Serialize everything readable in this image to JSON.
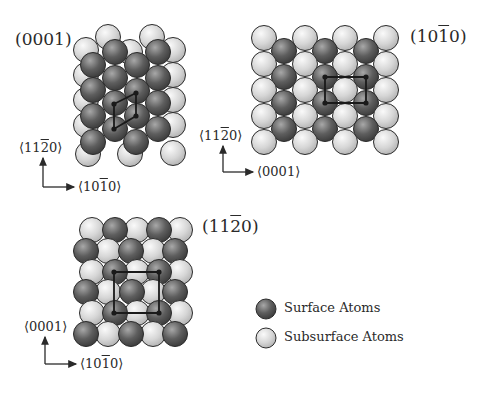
{
  "colors": {
    "surface": "#5a5a5a",
    "surface_light": "#9a9a9a",
    "subsurface": "#d4d4d4",
    "subsurface_light": "#f4f4f4",
    "outline": "#2b2b2b",
    "cell": "#1a1a1a",
    "text": "#2a2a2a"
  },
  "atom_radius": 12.5,
  "panels": [
    {
      "id": "0001",
      "title": {
        "pre": "(000",
        "bar": "",
        "post": "1)",
        "x": 15,
        "y": 29
      },
      "axis": {
        "up_label": {
          "pre": "⟨11",
          "bar": "2",
          "post": "0⟩",
          "x": 19,
          "y": 140
        },
        "right_label": {
          "pre": "⟨10",
          "bar": "1",
          "post": "0⟩",
          "x": 78,
          "y": 179
        },
        "origin": [
          43,
          187
        ],
        "up_end": [
          43,
          158
        ],
        "right_end": [
          74,
          187
        ]
      },
      "atoms": [
        {
          "x": 108,
          "y": 37,
          "t": "sub"
        },
        {
          "x": 152,
          "y": 37,
          "t": "sub"
        },
        {
          "x": 86,
          "y": 50,
          "t": "sub"
        },
        {
          "x": 130,
          "y": 52,
          "t": "sub"
        },
        {
          "x": 173,
          "y": 50,
          "t": "sub"
        },
        {
          "x": 115,
          "y": 52,
          "t": "surf"
        },
        {
          "x": 158,
          "y": 52,
          "t": "surf"
        },
        {
          "x": 86,
          "y": 75,
          "t": "sub"
        },
        {
          "x": 173,
          "y": 75,
          "t": "sub"
        },
        {
          "x": 93,
          "y": 65,
          "t": "surf"
        },
        {
          "x": 137,
          "y": 65,
          "t": "surf"
        },
        {
          "x": 115,
          "y": 78,
          "t": "surf"
        },
        {
          "x": 158,
          "y": 78,
          "t": "surf"
        },
        {
          "x": 86,
          "y": 100,
          "t": "sub"
        },
        {
          "x": 173,
          "y": 100,
          "t": "sub"
        },
        {
          "x": 93,
          "y": 90,
          "t": "surf"
        },
        {
          "x": 137,
          "y": 91,
          "t": "surf"
        },
        {
          "x": 115,
          "y": 103,
          "t": "surf"
        },
        {
          "x": 158,
          "y": 103,
          "t": "surf"
        },
        {
          "x": 86,
          "y": 125,
          "t": "sub"
        },
        {
          "x": 173,
          "y": 125,
          "t": "sub"
        },
        {
          "x": 93,
          "y": 116,
          "t": "surf"
        },
        {
          "x": 137,
          "y": 116,
          "t": "surf"
        },
        {
          "x": 115,
          "y": 129,
          "t": "surf"
        },
        {
          "x": 158,
          "y": 129,
          "t": "surf"
        },
        {
          "x": 88,
          "y": 154,
          "t": "sub"
        },
        {
          "x": 130,
          "y": 154,
          "t": "sub"
        },
        {
          "x": 173,
          "y": 153,
          "t": "sub"
        },
        {
          "x": 93,
          "y": 142,
          "t": "surf"
        },
        {
          "x": 136,
          "y": 142,
          "t": "surf"
        }
      ],
      "cell": [
        [
          136,
          93
        ],
        [
          114,
          104
        ],
        [
          114,
          129
        ],
        [
          136,
          116
        ]
      ]
    },
    {
      "id": "10-10",
      "title": {
        "pre": "(10",
        "bar": "1",
        "post": "0)",
        "x": 410,
        "y": 26
      },
      "axis": {
        "up_label": {
          "pre": "⟨11",
          "bar": "2",
          "post": "0⟩",
          "x": 199,
          "y": 128
        },
        "right_label": {
          "pre": "⟨000",
          "bar": "",
          "post": "1⟩",
          "x": 257,
          "y": 164
        },
        "origin": [
          223,
          172
        ],
        "up_end": [
          223,
          146
        ],
        "right_end": [
          253,
          172
        ]
      },
      "atoms": [
        {
          "x": 264,
          "y": 38,
          "t": "sub"
        },
        {
          "x": 305,
          "y": 38,
          "t": "sub"
        },
        {
          "x": 345,
          "y": 38,
          "t": "sub"
        },
        {
          "x": 386,
          "y": 38,
          "t": "sub"
        },
        {
          "x": 284,
          "y": 51,
          "t": "surf"
        },
        {
          "x": 325,
          "y": 51,
          "t": "surf"
        },
        {
          "x": 366,
          "y": 51,
          "t": "surf"
        },
        {
          "x": 264,
          "y": 64,
          "t": "sub"
        },
        {
          "x": 305,
          "y": 64,
          "t": "sub"
        },
        {
          "x": 345,
          "y": 64,
          "t": "sub"
        },
        {
          "x": 386,
          "y": 64,
          "t": "sub"
        },
        {
          "x": 284,
          "y": 77,
          "t": "surf"
        },
        {
          "x": 325,
          "y": 77,
          "t": "surf"
        },
        {
          "x": 366,
          "y": 77,
          "t": "surf"
        },
        {
          "x": 264,
          "y": 90,
          "t": "sub"
        },
        {
          "x": 305,
          "y": 90,
          "t": "sub"
        },
        {
          "x": 345,
          "y": 90,
          "t": "sub"
        },
        {
          "x": 386,
          "y": 90,
          "t": "sub"
        },
        {
          "x": 284,
          "y": 103,
          "t": "surf"
        },
        {
          "x": 325,
          "y": 103,
          "t": "surf"
        },
        {
          "x": 366,
          "y": 103,
          "t": "surf"
        },
        {
          "x": 264,
          "y": 116,
          "t": "sub"
        },
        {
          "x": 305,
          "y": 116,
          "t": "sub"
        },
        {
          "x": 345,
          "y": 116,
          "t": "sub"
        },
        {
          "x": 386,
          "y": 116,
          "t": "sub"
        },
        {
          "x": 284,
          "y": 129,
          "t": "surf"
        },
        {
          "x": 325,
          "y": 129,
          "t": "surf"
        },
        {
          "x": 366,
          "y": 129,
          "t": "surf"
        },
        {
          "x": 264,
          "y": 142,
          "t": "sub"
        },
        {
          "x": 305,
          "y": 142,
          "t": "sub"
        },
        {
          "x": 345,
          "y": 142,
          "t": "sub"
        },
        {
          "x": 386,
          "y": 142,
          "t": "sub"
        }
      ],
      "cell": [
        [
          325,
          77
        ],
        [
          366,
          77
        ],
        [
          366,
          103
        ],
        [
          325,
          103
        ]
      ]
    },
    {
      "id": "11-20",
      "title": {
        "pre": "(11",
        "bar": "2",
        "post": "0)",
        "x": 202,
        "y": 216
      },
      "axis": {
        "up_label": {
          "pre": "⟨000",
          "bar": "",
          "post": "1⟩",
          "x": 24,
          "y": 319
        },
        "right_label": {
          "pre": "⟨10",
          "bar": "1",
          "post": "0⟩",
          "x": 80,
          "y": 356
        },
        "origin": [
          45,
          364
        ],
        "up_end": [
          45,
          337
        ],
        "right_end": [
          76,
          364
        ]
      },
      "atoms": [
        {
          "x": 92,
          "y": 230,
          "t": "sub"
        },
        {
          "x": 137,
          "y": 230,
          "t": "sub"
        },
        {
          "x": 180,
          "y": 230,
          "t": "sub"
        },
        {
          "x": 115,
          "y": 230,
          "t": "surf"
        },
        {
          "x": 159,
          "y": 230,
          "t": "surf"
        },
        {
          "x": 108,
          "y": 251,
          "t": "sub"
        },
        {
          "x": 153,
          "y": 251,
          "t": "sub"
        },
        {
          "x": 86,
          "y": 251,
          "t": "surf"
        },
        {
          "x": 131,
          "y": 251,
          "t": "surf"
        },
        {
          "x": 175,
          "y": 251,
          "t": "surf"
        },
        {
          "x": 92,
          "y": 272,
          "t": "sub"
        },
        {
          "x": 137,
          "y": 272,
          "t": "sub"
        },
        {
          "x": 180,
          "y": 272,
          "t": "sub"
        },
        {
          "x": 115,
          "y": 272,
          "t": "surf"
        },
        {
          "x": 159,
          "y": 272,
          "t": "surf"
        },
        {
          "x": 108,
          "y": 292,
          "t": "sub"
        },
        {
          "x": 153,
          "y": 292,
          "t": "sub"
        },
        {
          "x": 86,
          "y": 292,
          "t": "surf"
        },
        {
          "x": 132,
          "y": 292,
          "t": "surf"
        },
        {
          "x": 175,
          "y": 292,
          "t": "surf"
        },
        {
          "x": 92,
          "y": 313,
          "t": "sub"
        },
        {
          "x": 137,
          "y": 313,
          "t": "sub"
        },
        {
          "x": 180,
          "y": 313,
          "t": "sub"
        },
        {
          "x": 115,
          "y": 313,
          "t": "surf"
        },
        {
          "x": 159,
          "y": 313,
          "t": "surf"
        },
        {
          "x": 108,
          "y": 334,
          "t": "sub"
        },
        {
          "x": 153,
          "y": 334,
          "t": "sub"
        },
        {
          "x": 86,
          "y": 334,
          "t": "surf"
        },
        {
          "x": 131,
          "y": 334,
          "t": "surf"
        },
        {
          "x": 175,
          "y": 334,
          "t": "surf"
        }
      ],
      "cell": [
        [
          114,
          272
        ],
        [
          159,
          272
        ],
        [
          159,
          313
        ],
        [
          114,
          313
        ]
      ]
    }
  ],
  "legend": {
    "items": [
      {
        "label": "Surface Atoms",
        "type": "surf",
        "x": 266,
        "y": 309
      },
      {
        "label": "Subsurface Atoms",
        "type": "sub",
        "x": 266,
        "y": 338
      }
    ],
    "radius": 10,
    "text_x": 284
  }
}
